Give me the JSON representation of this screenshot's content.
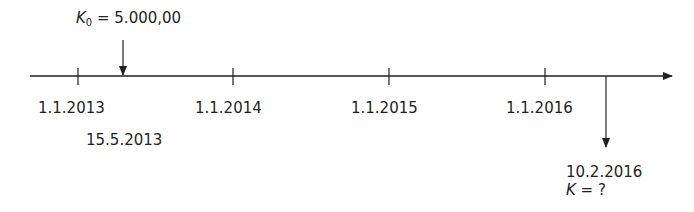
{
  "timeline": {
    "start_value": {
      "symbol": "K",
      "subscript": "0",
      "equals": " = ",
      "amount": "5.000,00"
    },
    "ticks": [
      {
        "label": "1.1.2013"
      },
      {
        "label": "1.1.2014"
      },
      {
        "label": "1.1.2015"
      },
      {
        "label": "1.1.2016"
      }
    ],
    "deposit_date": "15.5.2013",
    "end": {
      "date": "10.2.2016",
      "symbol": "K",
      "equals": " = ",
      "value": "?"
    }
  }
}
